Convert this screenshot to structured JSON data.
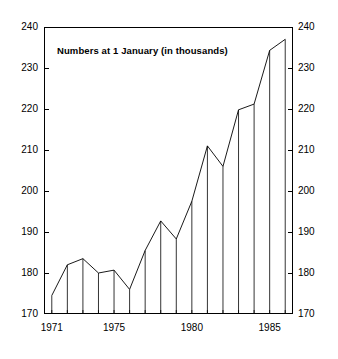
{
  "chart_data": {
    "type": "line",
    "title": "Numbers at 1 January (in thousands)",
    "xlabel": "",
    "ylabel": "",
    "x": [
      1971,
      1972,
      1973,
      1974,
      1975,
      1976,
      1977,
      1978,
      1979,
      1980,
      1981,
      1982,
      1983,
      1984,
      1985,
      1986
    ],
    "values": [
      174.5,
      182,
      183.5,
      180,
      180.7,
      176,
      185.5,
      192.7,
      188.3,
      197.5,
      211,
      206,
      219.8,
      221.2,
      234.3,
      237
    ],
    "categories": [
      "1971",
      "1972",
      "1973",
      "1974",
      "1975",
      "1976",
      "1977",
      "1978",
      "1979",
      "1980",
      "1981",
      "1982",
      "1983",
      "1984",
      "1985",
      "1986"
    ],
    "ylim": [
      170,
      240
    ],
    "xlim": [
      1970.5,
      1986.5
    ],
    "ytick_values": [
      170,
      180,
      190,
      200,
      210,
      220,
      230,
      240
    ],
    "ytick_labels_left": [
      "240",
      "230",
      "220",
      "210",
      "200",
      "190",
      "180",
      "170"
    ],
    "ytick_labels_right": [
      "240",
      "230",
      "220",
      "210",
      "200",
      "190",
      "180",
      "170"
    ],
    "xtick_values": [
      1971,
      1975,
      1980,
      1985
    ],
    "xtick_labels": [
      "1971",
      "1975",
      "1980",
      "1985"
    ],
    "grid": false,
    "legend": "none",
    "dual_y_axis": true,
    "drop_lines": true,
    "line_color": "#000000",
    "background_color": "#ffffff"
  },
  "axes": {
    "left_ticks": [
      {
        "label": "240",
        "value": 240
      },
      {
        "label": "230",
        "value": 230
      },
      {
        "label": "220",
        "value": 220
      },
      {
        "label": "210",
        "value": 210
      },
      {
        "label": "200",
        "value": 200
      },
      {
        "label": "190",
        "value": 190
      },
      {
        "label": "180",
        "value": 180
      },
      {
        "label": "170",
        "value": 170
      }
    ],
    "right_ticks": [
      {
        "label": "240",
        "value": 240
      },
      {
        "label": "230",
        "value": 230
      },
      {
        "label": "220",
        "value": 220
      },
      {
        "label": "210",
        "value": 210
      },
      {
        "label": "200",
        "value": 200
      },
      {
        "label": "190",
        "value": 190
      },
      {
        "label": "180",
        "value": 180
      },
      {
        "label": "170",
        "value": 170
      }
    ],
    "bottom_ticks": [
      {
        "label": "1971",
        "value": 1971
      },
      {
        "label": "1975",
        "value": 1975
      },
      {
        "label": "1980",
        "value": 1980
      },
      {
        "label": "1985",
        "value": 1985
      }
    ]
  }
}
